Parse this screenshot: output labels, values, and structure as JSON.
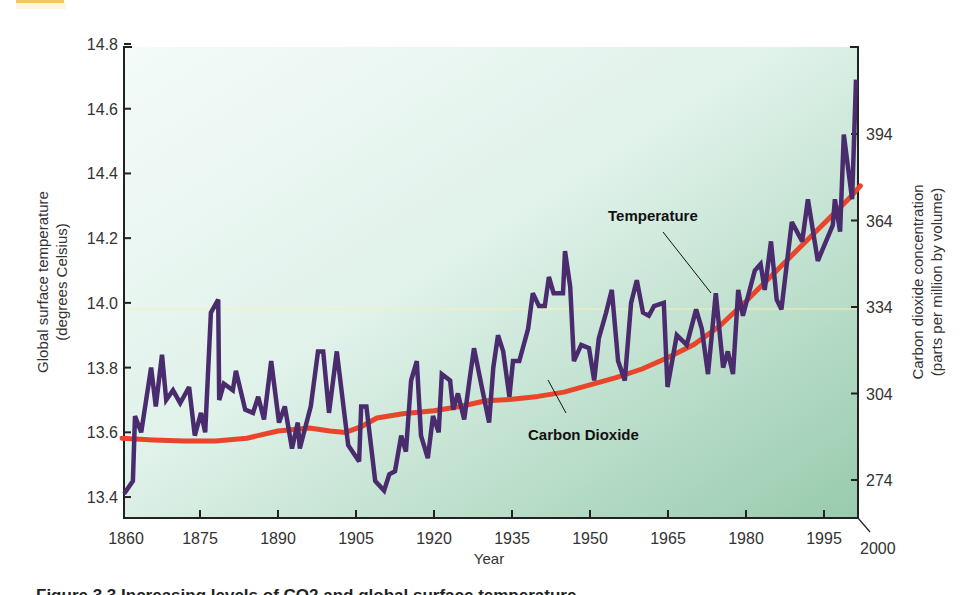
{
  "chart_data": {
    "type": "line",
    "title": "",
    "xlabel": "Year",
    "ylabel": "Global surface temperature (degrees Celsius)",
    "ylabel_lines": [
      "Global surface temperature",
      "(degrees Celsius)"
    ],
    "y2label": "Carbon dioxide concentration (parts per million by volume)",
    "y2label_lines": [
      "Carbon dioxide concentration",
      "(parts per million by volume)"
    ],
    "xlim": [
      1860,
      2000
    ],
    "ylim": [
      13.4,
      14.8
    ],
    "y2lim": [
      262,
      408
    ],
    "x_ticks": [
      "1860",
      "1875",
      "1890",
      "1905",
      "1920",
      "1935",
      "1950",
      "1965",
      "1980",
      "1995",
      "2000"
    ],
    "y_ticks": [
      "14.8",
      "14.6",
      "14.4",
      "14.2",
      "14.0",
      "13.8",
      "13.6",
      "13.4"
    ],
    "y2_ticks": [
      "394",
      "364",
      "334",
      "304",
      "274"
    ],
    "grid": "single horizontal reference line at 14.0",
    "legend": "inline labels",
    "annotations": [
      {
        "text": "Temperature",
        "target_series": "Temperature"
      },
      {
        "text": "Carbon Dioxide",
        "target_series": "Carbon Dioxide"
      }
    ],
    "series": [
      {
        "name": "Temperature",
        "axis": "left",
        "color": "#4a2c6e",
        "points": [
          [
            1860.4,
            13.41
          ],
          [
            1862.1,
            13.45
          ],
          [
            1862.5,
            13.65
          ],
          [
            1863.7,
            13.6
          ],
          [
            1865.6,
            13.8
          ],
          [
            1866.5,
            13.68
          ],
          [
            1867.7,
            13.84
          ],
          [
            1868.5,
            13.7
          ],
          [
            1869.8,
            13.73
          ],
          [
            1871.2,
            13.69
          ],
          [
            1872.9,
            13.74
          ],
          [
            1874.0,
            13.59
          ],
          [
            1875.2,
            13.66
          ],
          [
            1876.0,
            13.6
          ],
          [
            1877.1,
            13.97
          ],
          [
            1878.5,
            14.01
          ],
          [
            1878.7,
            13.7
          ],
          [
            1879.6,
            13.75
          ],
          [
            1881.3,
            13.73
          ],
          [
            1881.9,
            13.79
          ],
          [
            1883.7,
            13.67
          ],
          [
            1885.2,
            13.66
          ],
          [
            1886.2,
            13.71
          ],
          [
            1887.3,
            13.64
          ],
          [
            1888.7,
            13.82
          ],
          [
            1890.2,
            13.63
          ],
          [
            1891.3,
            13.68
          ],
          [
            1892.7,
            13.55
          ],
          [
            1893.8,
            13.63
          ],
          [
            1894.2,
            13.55
          ],
          [
            1896.3,
            13.68
          ],
          [
            1897.7,
            13.85
          ],
          [
            1898.7,
            13.85
          ],
          [
            1899.8,
            13.66
          ],
          [
            1901.3,
            13.85
          ],
          [
            1903.5,
            13.56
          ],
          [
            1905.6,
            13.51
          ],
          [
            1906.0,
            13.68
          ],
          [
            1907.0,
            13.68
          ],
          [
            1908.7,
            13.45
          ],
          [
            1910.4,
            13.42
          ],
          [
            1911.4,
            13.47
          ],
          [
            1912.5,
            13.48
          ],
          [
            1913.7,
            13.59
          ],
          [
            1914.6,
            13.54
          ],
          [
            1915.6,
            13.76
          ],
          [
            1916.7,
            13.82
          ],
          [
            1917.5,
            13.59
          ],
          [
            1918.8,
            13.52
          ],
          [
            1919.8,
            13.65
          ],
          [
            1920.9,
            13.6
          ],
          [
            1921.5,
            13.78
          ],
          [
            1923.1,
            13.76
          ],
          [
            1923.7,
            13.67
          ],
          [
            1924.6,
            13.72
          ],
          [
            1925.8,
            13.64
          ],
          [
            1926.9,
            13.77
          ],
          [
            1927.7,
            13.86
          ],
          [
            1929.2,
            13.74
          ],
          [
            1930.6,
            13.63
          ],
          [
            1931.4,
            13.8
          ],
          [
            1932.3,
            13.9
          ],
          [
            1933.3,
            13.85
          ],
          [
            1934.5,
            13.71
          ],
          [
            1935.2,
            13.82
          ],
          [
            1936.4,
            13.82
          ],
          [
            1938.1,
            13.92
          ],
          [
            1939.0,
            14.03
          ],
          [
            1940.2,
            13.99
          ],
          [
            1941.3,
            13.99
          ],
          [
            1942.1,
            14.08
          ],
          [
            1943.0,
            14.03
          ],
          [
            1944.8,
            14.03
          ],
          [
            1945.2,
            14.16
          ],
          [
            1946.2,
            14.05
          ],
          [
            1946.9,
            13.82
          ],
          [
            1948.3,
            13.87
          ],
          [
            1949.8,
            13.86
          ],
          [
            1950.8,
            13.76
          ],
          [
            1951.7,
            13.89
          ],
          [
            1953.1,
            13.97
          ],
          [
            1954.2,
            14.04
          ],
          [
            1955.4,
            13.82
          ],
          [
            1956.7,
            13.76
          ],
          [
            1957.9,
            14.0
          ],
          [
            1959.0,
            14.07
          ],
          [
            1960.2,
            13.97
          ],
          [
            1961.3,
            13.96
          ],
          [
            1962.3,
            13.99
          ],
          [
            1964.2,
            14.0
          ],
          [
            1964.9,
            13.74
          ],
          [
            1966.7,
            13.9
          ],
          [
            1968.6,
            13.87
          ],
          [
            1970.4,
            13.98
          ],
          [
            1971.5,
            13.92
          ],
          [
            1972.7,
            13.78
          ],
          [
            1974.2,
            14.03
          ],
          [
            1975.6,
            13.8
          ],
          [
            1976.5,
            13.85
          ],
          [
            1977.5,
            13.78
          ],
          [
            1978.5,
            14.04
          ],
          [
            1979.4,
            13.96
          ],
          [
            1981.7,
            14.1
          ],
          [
            1982.8,
            14.12
          ],
          [
            1983.6,
            14.04
          ],
          [
            1984.8,
            14.19
          ],
          [
            1985.9,
            14.01
          ],
          [
            1986.8,
            13.98
          ],
          [
            1988.8,
            14.25
          ],
          [
            1990.8,
            14.19
          ],
          [
            1991.9,
            14.32
          ],
          [
            1993.8,
            14.13
          ],
          [
            1996.7,
            14.24
          ],
          [
            1997.1,
            14.32
          ],
          [
            1998.1,
            14.22
          ],
          [
            1998.8,
            14.52
          ],
          [
            2000.4,
            14.32
          ],
          [
            2002.0,
            14.69
          ]
        ]
      },
      {
        "name": "Carbon Dioxide",
        "axis": "right",
        "color": "#e8452a",
        "points": [
          [
            1860,
            288.5
          ],
          [
            1866,
            287.9
          ],
          [
            1872,
            287.5
          ],
          [
            1878,
            287.5
          ],
          [
            1884,
            288.5
          ],
          [
            1890,
            291.0
          ],
          [
            1896,
            292.0
          ],
          [
            1900,
            291.0
          ],
          [
            1903,
            290.5
          ],
          [
            1906,
            292.5
          ],
          [
            1909,
            295.5
          ],
          [
            1914,
            297.0
          ],
          [
            1920,
            298.0
          ],
          [
            1925,
            299.5
          ],
          [
            1930,
            301.5
          ],
          [
            1935,
            302.0
          ],
          [
            1940,
            303.0
          ],
          [
            1945,
            304.5
          ],
          [
            1950,
            307.0
          ],
          [
            1955,
            309.5
          ],
          [
            1960,
            312.5
          ],
          [
            1965,
            316.5
          ],
          [
            1970,
            321.0
          ],
          [
            1975,
            327.5
          ],
          [
            1980,
            336.0
          ],
          [
            1985,
            345.0
          ],
          [
            1990,
            354.0
          ],
          [
            1995,
            363.0
          ],
          [
            2000,
            372.0
          ],
          [
            2002,
            376.0
          ]
        ]
      }
    ]
  },
  "caption": {
    "text": "Figure 3.3 Increasing levels of CO2 and global surface temperature"
  },
  "colors": {
    "background_top": "#f1faf7",
    "background_bottom": "#9fd0b4",
    "temperature": "#4a2c6e",
    "co2": "#e8452a",
    "badge": "#f5c469",
    "reference_line": "#f6f0b5"
  }
}
